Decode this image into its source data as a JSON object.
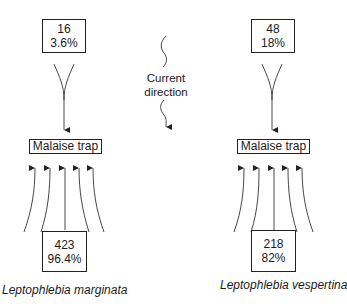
{
  "current": {
    "line1": "Current",
    "line2": "direction"
  },
  "species": [
    {
      "name": "Leptophlebia marginata",
      "upstream": {
        "count": "16",
        "percent": "3.6%"
      },
      "trap_label": "Malaise trap",
      "downstream": {
        "count": "423",
        "percent": "96.4%"
      }
    },
    {
      "name": "Leptophlebia vespertina",
      "upstream": {
        "count": "48",
        "percent": "18%"
      },
      "trap_label": "Malaise trap",
      "downstream": {
        "count": "218",
        "percent": "82%"
      }
    }
  ]
}
